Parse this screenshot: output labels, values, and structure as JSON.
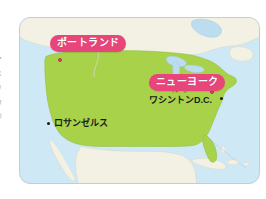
{
  "map": {
    "title": "United States map with Japanese city labels",
    "colors": {
      "ocean": "#cfe8f6",
      "usa_land": "#a8d24a",
      "neighbor_land": "#f2f1e4",
      "lake": "#bcdcf0",
      "label_pink": "#e8457a",
      "label_text": "#ffffff",
      "city_text": "#1b1b1b",
      "panel_border": "#c3ced4"
    },
    "pill_labels": [
      {
        "id": "portland",
        "text": "ポートランド"
      },
      {
        "id": "newyork",
        "text": "ニューヨーク"
      }
    ],
    "city_labels": [
      {
        "id": "losangeles",
        "text": "ロサンゼルス",
        "marker": "dot"
      },
      {
        "id": "washington",
        "base": "ワシントンD.C.",
        "ruby": "ディーシー",
        "marker": "dot"
      }
    ],
    "markers": [
      {
        "id": "portland",
        "style": "pink"
      },
      {
        "id": "newyork",
        "style": "pink"
      },
      {
        "id": "washington",
        "style": "black"
      },
      {
        "id": "losangeles",
        "style": "black"
      }
    ]
  },
  "margin_fragments": [
    "ア",
    "メ",
    "リ",
    "カ",
    "の",
    "・"
  ]
}
